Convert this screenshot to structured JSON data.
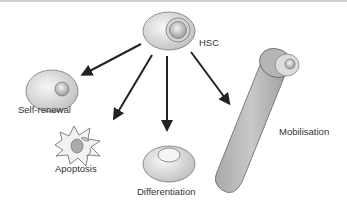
{
  "diagram": {
    "nodes": [
      {
        "id": "hsc",
        "label": "HSC"
      },
      {
        "id": "self_renewal",
        "label": "Self-renewal"
      },
      {
        "id": "apoptosis",
        "label": "Apoptosis"
      },
      {
        "id": "differentiation",
        "label": "Differentiation"
      },
      {
        "id": "mobilisation",
        "label": "Mobilisation"
      }
    ],
    "edges": [
      {
        "from": "hsc",
        "to": "self_renewal"
      },
      {
        "from": "hsc",
        "to": "apoptosis"
      },
      {
        "from": "hsc",
        "to": "differentiation"
      },
      {
        "from": "hsc",
        "to": "mobilisation"
      }
    ]
  }
}
